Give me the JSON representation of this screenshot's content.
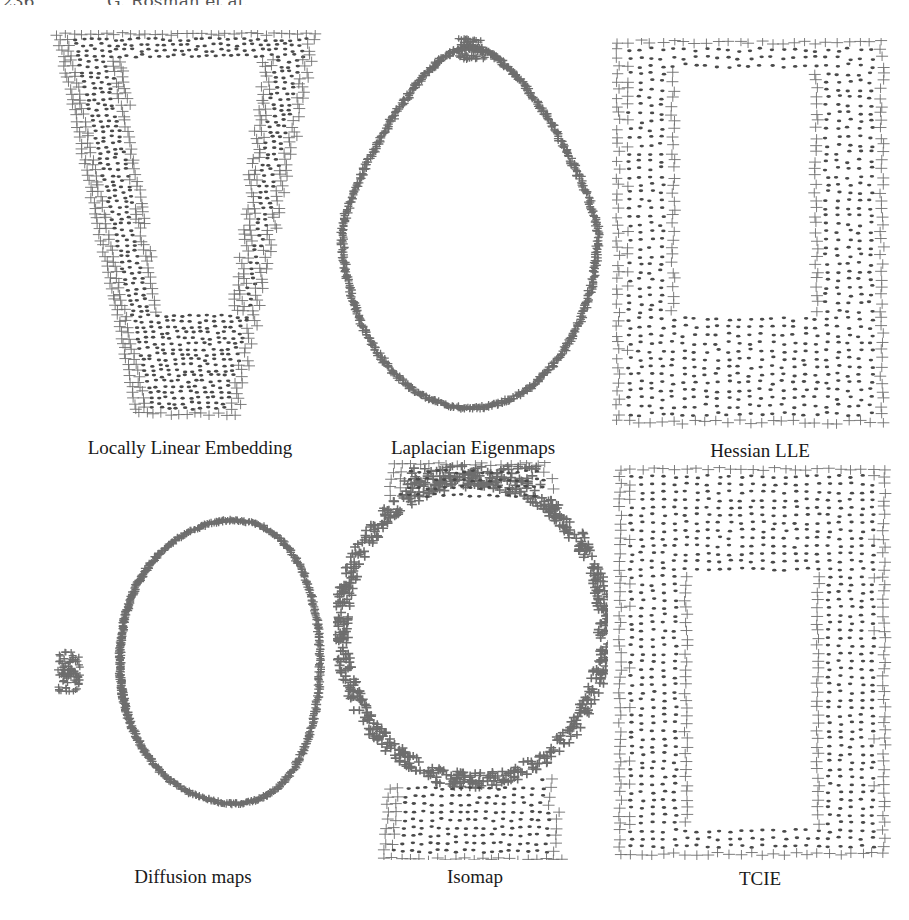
{
  "running_head": {
    "page_number": "236",
    "authors": "G. Rosman et al."
  },
  "figure": {
    "marker_color": "#6e6e6e",
    "dot_color": "#4a4a4a",
    "panels": [
      {
        "id": "lle",
        "caption": "Locally Linear Embedding",
        "shape": "inverted-trapezoid-with-hole"
      },
      {
        "id": "laplacian",
        "caption": "Laplacian Eigenmaps",
        "shape": "teardrop-curve"
      },
      {
        "id": "hessian",
        "caption": "Hessian LLE",
        "shape": "rectangle-with-hole"
      },
      {
        "id": "diffusion",
        "caption": "Diffusion maps",
        "shape": "rounded-triangle-curve"
      },
      {
        "id": "isomap",
        "caption": "Isomap",
        "shape": "ring-over-band"
      },
      {
        "id": "tcie",
        "caption": "TCIE",
        "shape": "rectangle-with-hole"
      }
    ]
  }
}
